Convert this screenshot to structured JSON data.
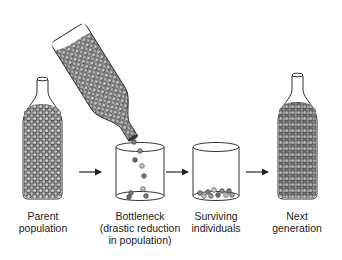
{
  "stages": [
    {
      "id": "parent",
      "label_lines": [
        "Parent",
        "population"
      ],
      "center_x": 42
    },
    {
      "id": "bottleneck",
      "label_lines": [
        "Bottleneck",
        "(drastic reduction",
        "in population)"
      ],
      "center_x": 140
    },
    {
      "id": "surviving",
      "label_lines": [
        "Surviving",
        "individuals"
      ],
      "center_x": 216
    },
    {
      "id": "next",
      "label_lines": [
        "Next",
        "generation"
      ],
      "center_x": 297
    }
  ],
  "arrows": [
    {
      "from": "parent",
      "to": "bottleneck"
    },
    {
      "from": "bottleneck",
      "to": "surviving"
    },
    {
      "from": "surviving",
      "to": "next"
    }
  ],
  "colors": {
    "outline": "#333333",
    "bead_dark": "#6e6e6e",
    "bead_light": "#bdbdbd",
    "bead_fill_bg": "#4a4a4a",
    "text": "#1a1a1a"
  }
}
